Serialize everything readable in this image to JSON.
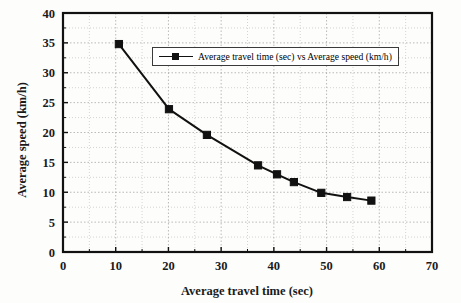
{
  "chart_data": {
    "type": "line",
    "title": "",
    "xlabel": "Average travel time (sec)",
    "ylabel": "Average speed (km/h)",
    "xlim": [
      0,
      70
    ],
    "ylim": [
      0,
      40
    ],
    "xticks": [
      0,
      10,
      20,
      30,
      40,
      50,
      60,
      70
    ],
    "yticks": [
      0,
      5,
      10,
      15,
      20,
      25,
      30,
      35,
      40
    ],
    "xtick_labels": [
      "0",
      "10",
      "20",
      "30",
      "40",
      "50",
      "60",
      "70"
    ],
    "ytick_labels": [
      "0",
      "5",
      "10",
      "15",
      "20",
      "25",
      "30",
      "35",
      "40"
    ],
    "grid": true,
    "grid_style": "dotted",
    "minor_grid": true,
    "legend_position": "upper center",
    "series": [
      {
        "name": "Average travel time (sec) vs Average speed (km/h)",
        "marker": "square",
        "color": "#111111",
        "x": [
          10.6,
          20.1,
          27.3,
          37.0,
          40.6,
          43.8,
          49.0,
          53.9,
          58.5
        ],
        "y": [
          34.8,
          23.9,
          19.6,
          14.5,
          13.0,
          11.7,
          9.9,
          9.2,
          8.6
        ],
        "points": [
          {
            "x": 10.6,
            "y": 34.8
          },
          {
            "x": 20.1,
            "y": 23.9
          },
          {
            "x": 27.3,
            "y": 19.6
          },
          {
            "x": 37.0,
            "y": 14.5
          },
          {
            "x": 40.6,
            "y": 13.0
          },
          {
            "x": 43.8,
            "y": 11.7
          },
          {
            "x": 49.0,
            "y": 9.9
          },
          {
            "x": 53.9,
            "y": 9.2
          },
          {
            "x": 58.5,
            "y": 8.6
          }
        ]
      }
    ]
  },
  "legend": {
    "entries": [
      {
        "label": "Average travel time (sec) vs Average speed (km/h)"
      }
    ]
  },
  "axes": {
    "x_title": "Average travel time (sec)",
    "y_title": "Average speed (km/h)"
  },
  "colors": {
    "series": "#111111",
    "axis": "#111111",
    "grid": "#b9b9b9",
    "background": "#fdfdfb"
  }
}
